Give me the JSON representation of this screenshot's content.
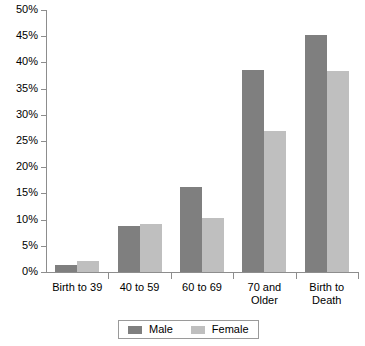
{
  "chart_data": {
    "type": "bar",
    "title": "",
    "xlabel": "",
    "ylabel": "",
    "ylim": [
      0,
      50
    ],
    "y_tick_labels": [
      "0%",
      "5%",
      "10%",
      "15%",
      "20%",
      "25%",
      "30%",
      "35%",
      "40%",
      "45%",
      "50%"
    ],
    "y_tick_values": [
      0,
      5,
      10,
      15,
      20,
      25,
      30,
      35,
      40,
      45,
      50
    ],
    "grid": false,
    "legend_position": "bottom-center",
    "categories": [
      "Birth to 39",
      "40 to 59",
      "60 to 69",
      "70 and Older",
      "Birth to Death"
    ],
    "category_lines": [
      [
        "Birth to 39"
      ],
      [
        "40 to 59"
      ],
      [
        "60 to 69"
      ],
      [
        "70 and",
        "Older"
      ],
      [
        "Birth to",
        "Death"
      ]
    ],
    "series": [
      {
        "name": "Male",
        "color": "#7f7f7f",
        "values": [
          1.4,
          8.7,
          16.2,
          38.6,
          45.2
        ]
      },
      {
        "name": "Female",
        "color": "#bfbfbf",
        "values": [
          2.1,
          9.2,
          10.4,
          27.0,
          38.4
        ]
      }
    ]
  },
  "legend": {
    "entries": [
      {
        "label": "Male"
      },
      {
        "label": "Female"
      }
    ]
  },
  "colors": {
    "male": "#7f7f7f",
    "female": "#bfbfbf",
    "axis": "#8d8d8d",
    "text": "#000000",
    "background": "#ffffff"
  }
}
